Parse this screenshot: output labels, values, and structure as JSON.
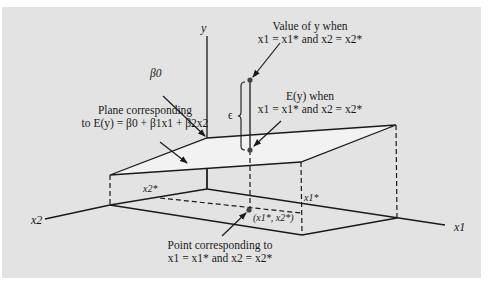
{
  "figure": {
    "axes": {
      "y": "y",
      "x1": "x1",
      "x2": "x2"
    },
    "labels": {
      "beta0": "β0",
      "plane_line1": "Plane corresponding",
      "plane_line2": "to E(y) = β0 + β1x1 + β2x2",
      "value_y_line1": "Value of y when",
      "value_y_line2": "x1 = x1* and x2 = x2*",
      "ey_line1": "E(y) when",
      "ey_line2": "x1 = x1* and x2 = x2*",
      "epsilon": "ϵ",
      "x1_star": "x1*",
      "x2_star": "x2*",
      "point_coord": "(x1*, x2*)",
      "point_line1": "Point corresponding to",
      "point_line2": "x1 = x1* and x2 = x2*"
    },
    "colors": {
      "panel": "#e3e3e3",
      "plane": "#f2f2f2",
      "line": "#1a1a1a",
      "point": "#444444"
    }
  }
}
